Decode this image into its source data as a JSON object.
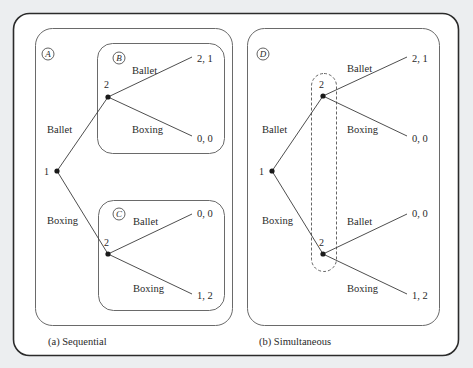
{
  "figure": {
    "panels": [
      {
        "id": "a",
        "caption": "(a) Sequential",
        "subgame_labels": {
          "outer": "A",
          "top": "B",
          "bottom": "C"
        },
        "root": {
          "player": "1"
        },
        "branches": [
          {
            "action": "Ballet",
            "node": {
              "player": "2"
            },
            "children": [
              {
                "action": "Ballet",
                "payoff": "2, 1"
              },
              {
                "action": "Boxing",
                "payoff": "0, 0"
              }
            ]
          },
          {
            "action": "Boxing",
            "node": {
              "player": "2"
            },
            "children": [
              {
                "action": "Ballet",
                "payoff": "0, 0"
              },
              {
                "action": "Boxing",
                "payoff": "1, 2"
              }
            ]
          }
        ]
      },
      {
        "id": "b",
        "caption": "(b) Simultaneous",
        "subgame_labels": {
          "outer": "D"
        },
        "information_set": "dashed oval connecting both player-2 nodes",
        "root": {
          "player": "1"
        },
        "branches": [
          {
            "action": "Ballet",
            "node": {
              "player": "2"
            },
            "children": [
              {
                "action": "Ballet",
                "payoff": "2, 1"
              },
              {
                "action": "Boxing",
                "payoff": "0, 0"
              }
            ]
          },
          {
            "action": "Boxing",
            "node": {
              "player": "2"
            },
            "children": [
              {
                "action": "Ballet",
                "payoff": "0, 0"
              },
              {
                "action": "Boxing",
                "payoff": "1, 2"
              }
            ]
          }
        ]
      }
    ],
    "colors": {
      "background": "#eceef0",
      "frame_fill": "#ffffff",
      "frame_stroke": "#2b2b2b",
      "box_stroke": "#6a6a6a",
      "line": "#3a3a3a",
      "text": "#2a2a2a"
    }
  }
}
